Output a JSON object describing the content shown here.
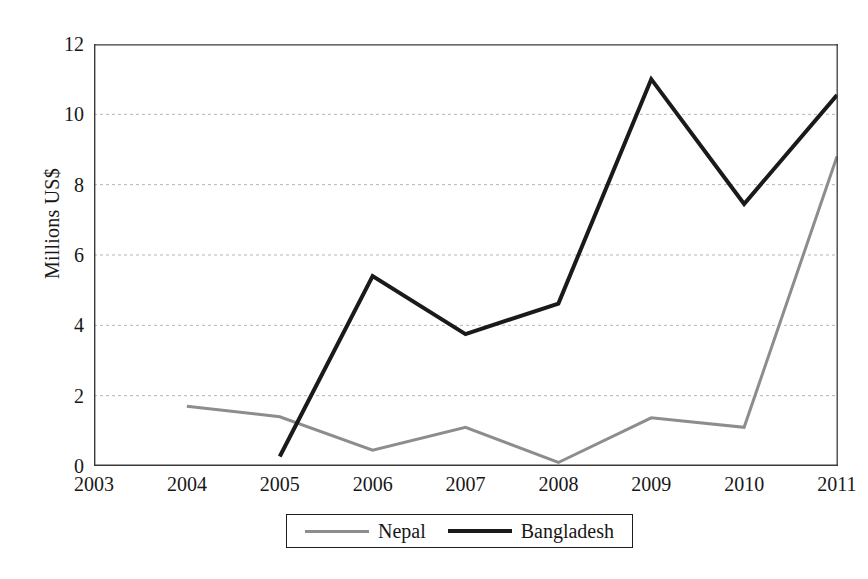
{
  "chart_data": {
    "type": "line",
    "title": "",
    "subtitle": "",
    "xlabel": "",
    "ylabel": "Millions US$",
    "categories": [
      "2003",
      "2004",
      "2005",
      "2006",
      "2007",
      "2008",
      "2009",
      "2010",
      "2011"
    ],
    "x": [
      2003,
      2004,
      2005,
      2006,
      2007,
      2008,
      2009,
      2010,
      2011
    ],
    "xlim": [
      2003,
      2011
    ],
    "ylim": [
      0,
      12
    ],
    "yticks": [
      0,
      2,
      4,
      6,
      8,
      10,
      12
    ],
    "ytick_labels": [
      "0",
      "2",
      "4",
      "6",
      "8",
      "10",
      "12"
    ],
    "grid": "horizontal-dotted",
    "legend_position": "bottom-center",
    "series": [
      {
        "name": "Nepal",
        "color": "#8d8d8d",
        "line_width": 3,
        "values": [
          null,
          1.7,
          1.4,
          0.45,
          1.1,
          0.1,
          1.37,
          1.1,
          8.8
        ]
      },
      {
        "name": "Bangladesh",
        "color": "#1a1a1a",
        "line_width": 4,
        "values": [
          1.4,
          null,
          0.27,
          5.4,
          3.75,
          4.62,
          11.0,
          7.45,
          10.55
        ]
      }
    ]
  },
  "axes": {
    "y_title": "Millions US$",
    "frame_color": "#3a3a3a",
    "gridline_color": "#b5b5b5"
  },
  "legend": {
    "entries": [
      {
        "label": "Nepal",
        "swatch": "nepal-line-swatch"
      },
      {
        "label": "Bangladesh",
        "swatch": "bangladesh-line-swatch"
      }
    ]
  }
}
